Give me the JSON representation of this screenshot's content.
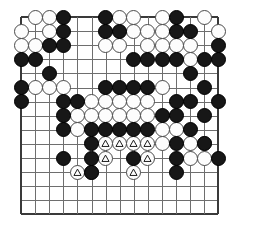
{
  "figure": {
    "name": "go-board-diagram",
    "type": "go-game-position",
    "background_color": "#ffffff",
    "line_color": "#6e6e6e",
    "edge_color": "#3a3a3a",
    "black_color": "#171717",
    "white_color": "#fdfdfd",
    "mark_symbol": "triangle"
  },
  "board": {
    "columns": 15,
    "rows": 15,
    "origin_x": 21,
    "origin_y": 17,
    "spacing": 14.1,
    "stone_diameter": 15,
    "hoshi_points": [
      [
        11,
        8
      ]
    ],
    "label": "15x15 board section"
  },
  "stones": {
    "black": [
      [
        4,
        1
      ],
      [
        7,
        1
      ],
      [
        12,
        1
      ],
      [
        4,
        2
      ],
      [
        7,
        2
      ],
      [
        8,
        2
      ],
      [
        12,
        2
      ],
      [
        13,
        2
      ],
      [
        3,
        3
      ],
      [
        4,
        3
      ],
      [
        15,
        3
      ],
      [
        1,
        4
      ],
      [
        2,
        4
      ],
      [
        9,
        4
      ],
      [
        10,
        4
      ],
      [
        11,
        4
      ],
      [
        12,
        4
      ],
      [
        14,
        4
      ],
      [
        15,
        4
      ],
      [
        3,
        5
      ],
      [
        13,
        5
      ],
      [
        1,
        6
      ],
      [
        7,
        6
      ],
      [
        8,
        6
      ],
      [
        9,
        6
      ],
      [
        10,
        6
      ],
      [
        14,
        6
      ],
      [
        1,
        7
      ],
      [
        4,
        7
      ],
      [
        5,
        7
      ],
      [
        12,
        7
      ],
      [
        13,
        7
      ],
      [
        15,
        7
      ],
      [
        4,
        8
      ],
      [
        11,
        8
      ],
      [
        12,
        8
      ],
      [
        14,
        8
      ],
      [
        4,
        9
      ],
      [
        6,
        9
      ],
      [
        7,
        9
      ],
      [
        8,
        9
      ],
      [
        9,
        9
      ],
      [
        10,
        9
      ],
      [
        13,
        9
      ],
      [
        6,
        10
      ],
      [
        12,
        10
      ],
      [
        14,
        10
      ],
      [
        4,
        11
      ],
      [
        6,
        11
      ],
      [
        9,
        11
      ],
      [
        12,
        11
      ],
      [
        15,
        11
      ],
      [
        6,
        12
      ],
      [
        12,
        12
      ]
    ],
    "white": [
      [
        2,
        1
      ],
      [
        3,
        1
      ],
      [
        8,
        1
      ],
      [
        9,
        1
      ],
      [
        11,
        1
      ],
      [
        14,
        1
      ],
      [
        1,
        2
      ],
      [
        3,
        2
      ],
      [
        9,
        2
      ],
      [
        10,
        2
      ],
      [
        11,
        2
      ],
      [
        15,
        2
      ],
      [
        1,
        3
      ],
      [
        2,
        3
      ],
      [
        7,
        3
      ],
      [
        8,
        3
      ],
      [
        10,
        3
      ],
      [
        11,
        3
      ],
      [
        12,
        3
      ],
      [
        13,
        3
      ],
      [
        13,
        4
      ],
      [
        2,
        6
      ],
      [
        3,
        6
      ],
      [
        4,
        6
      ],
      [
        11,
        6
      ],
      [
        6,
        7
      ],
      [
        7,
        7
      ],
      [
        8,
        7
      ],
      [
        9,
        7
      ],
      [
        10,
        7
      ],
      [
        5,
        8
      ],
      [
        6,
        8
      ],
      [
        7,
        8
      ],
      [
        8,
        8
      ],
      [
        9,
        8
      ],
      [
        10,
        8
      ],
      [
        5,
        9
      ],
      [
        11,
        9
      ],
      [
        12,
        9
      ],
      [
        11,
        10
      ],
      [
        13,
        10
      ],
      [
        14,
        10
      ],
      [
        13,
        11
      ],
      [
        14,
        11
      ]
    ],
    "white_marked": [
      [
        7,
        10
      ],
      [
        8,
        10
      ],
      [
        9,
        10
      ],
      [
        10,
        10
      ],
      [
        7,
        11
      ],
      [
        10,
        11
      ],
      [
        5,
        12
      ],
      [
        6,
        12
      ],
      [
        9,
        12
      ]
    ]
  },
  "marked_stones_note": {
    "count": 9,
    "symbol_name": "triangle-mark",
    "owner": "white"
  }
}
